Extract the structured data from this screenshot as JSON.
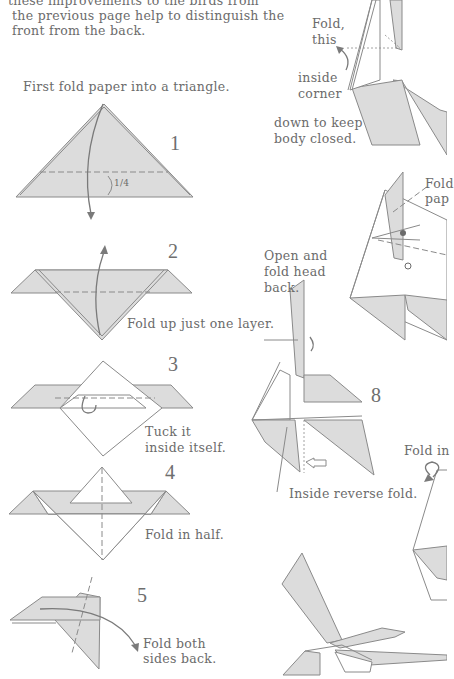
{
  "intro": {
    "line1": "these improvements to the birds from",
    "line2": "the previous page help to distinguish the",
    "line3": "front from the back."
  },
  "steps": [
    {
      "number": "1",
      "instruction": "First fold paper into a triangle.",
      "label": "1/4"
    },
    {
      "number": "2",
      "instruction": "Fold up just one layer."
    },
    {
      "number": "3",
      "instruction_line1": "Tuck it",
      "instruction_line2": "inside itself."
    },
    {
      "number": "4",
      "instruction": "Fold in half."
    },
    {
      "number": "5",
      "instruction_line1": "Fold both",
      "instruction_line2": "sides back."
    },
    {
      "number": "6",
      "instruction_line1": "Fold",
      "instruction_line2": "pap"
    },
    {
      "number": "7",
      "instruction_line1": "Open and",
      "instruction_line2": "fold head",
      "instruction_line3": "back."
    },
    {
      "number": "8",
      "instruction": "Inside reverse fold."
    },
    {
      "number": "9",
      "instruction": "Fold in"
    }
  ],
  "top_right_note": {
    "line1": "Fold,",
    "line2": "this",
    "line3": "inside",
    "line4": "corner",
    "line5": "down to keep",
    "line6": "body closed."
  },
  "colors": {
    "paper_fill": "#dcdcdc",
    "line": "#8a8a8a",
    "text": "#6b6b6b"
  }
}
